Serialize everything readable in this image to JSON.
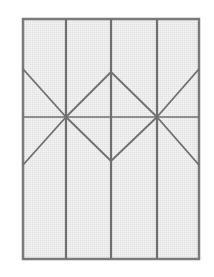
{
  "diagram": {
    "type": "crease-pattern",
    "sheet": {
      "x": 23,
      "y": 19,
      "width": 176,
      "height": 240,
      "fill": "#ebebeb",
      "stroke": "#7a7a7a"
    },
    "line_color": "#6f6f6f",
    "vertical_lines_x": [
      66,
      111,
      157
    ],
    "horizontal_lines_y": [
      117
    ],
    "diagonals": [
      {
        "x1": 23,
        "y1": 69,
        "x2": 66,
        "y2": 117
      },
      {
        "x1": 66,
        "y1": 117,
        "x2": 111,
        "y2": 72
      },
      {
        "x1": 111,
        "y1": 72,
        "x2": 157,
        "y2": 117
      },
      {
        "x1": 157,
        "y1": 117,
        "x2": 199,
        "y2": 69
      },
      {
        "x1": 23,
        "y1": 165,
        "x2": 66,
        "y2": 117
      },
      {
        "x1": 66,
        "y1": 117,
        "x2": 111,
        "y2": 161
      },
      {
        "x1": 111,
        "y1": 161,
        "x2": 157,
        "y2": 117
      },
      {
        "x1": 157,
        "y1": 117,
        "x2": 199,
        "y2": 165
      }
    ]
  }
}
